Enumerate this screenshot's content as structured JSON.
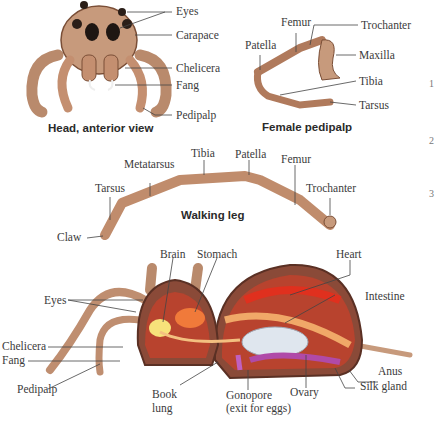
{
  "panels": {
    "head": {
      "caption": "Head, anterior view",
      "labels": {
        "eyes": "Eyes",
        "carapace": "Carapace",
        "chelicera": "Chelicera",
        "fang": "Fang",
        "pedipalp": "Pedipalp"
      }
    },
    "pedipalp": {
      "caption": "Female pedipalp",
      "labels": {
        "femur": "Femur",
        "trochanter": "Trochanter",
        "patella": "Patella",
        "maxilla": "Maxilla",
        "tibia": "Tibia",
        "tarsus": "Tarsus"
      }
    },
    "leg": {
      "caption": "Walking leg",
      "labels": {
        "tibia": "Tibia",
        "patella": "Patella",
        "femur": "Femur",
        "metatarsus": "Metatarsus",
        "tarsus": "Tarsus",
        "trochanter": "Trochanter",
        "claw": "Claw"
      }
    },
    "internal": {
      "labels": {
        "brain": "Brain",
        "stomach": "Stomach",
        "heart": "Heart",
        "eyes": "Eyes",
        "intestine": "Intestine",
        "chelicera": "Chelicera",
        "fang": "Fang",
        "anus": "Anus",
        "pedipalp": "Pedipalp",
        "book_lung_1": "Book",
        "book_lung_2": "lung",
        "gonopore_1": "Gonopore",
        "gonopore_2": "(exit for eggs)",
        "ovary": "Ovary",
        "silk_gland": "Silk gland"
      }
    }
  },
  "margin_marks": [
    "1",
    "2",
    "3"
  ],
  "colors": {
    "body": "#c79a7c",
    "body_dark": "#8a5a40",
    "interior": "#b8432e",
    "heart": "#e0301e",
    "brain": "#f7e27a",
    "ovary": "#dfe6ee",
    "silk": "#b04aa8",
    "line": "#444444"
  }
}
